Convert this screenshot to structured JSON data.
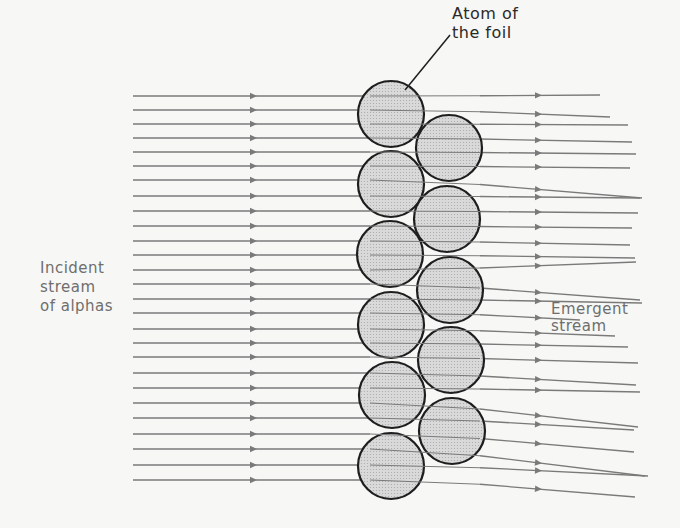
{
  "diagram": {
    "labels": {
      "atom": [
        "Atom of",
        "the foil"
      ],
      "incident": [
        "Incident",
        "stream",
        "of alphas"
      ],
      "emergent": [
        "Emergent",
        "stream"
      ]
    },
    "colors": {
      "background": "#f7f7f5",
      "line": "#7a7a7a",
      "atom_fill": "#d9d9d9",
      "atom_stroke": "#1e1e1e",
      "text": "#6e6e6e",
      "text_dark": "#2a2a2a"
    },
    "atoms": {
      "radius": 33,
      "left_column": [
        [
          391,
          114
        ],
        [
          391,
          184
        ],
        [
          390,
          254
        ],
        [
          391,
          325
        ],
        [
          392,
          395
        ],
        [
          391,
          466
        ]
      ],
      "right_column": [
        [
          449,
          148
        ],
        [
          447,
          219
        ],
        [
          450,
          290
        ],
        [
          451,
          360
        ],
        [
          452,
          431
        ]
      ]
    },
    "pointer_line": [
      [
        405,
        90
      ],
      [
        450,
        35
      ]
    ],
    "incident_start_x": 133,
    "incident_arrow_x": 250,
    "emergent_arrow_x": 535,
    "paths": [
      {
        "y_in": 96,
        "y_out": 95,
        "end_x": 600
      },
      {
        "y_in": 110,
        "y_out": 117,
        "end_x": 610
      },
      {
        "y_in": 124,
        "y_out": 125,
        "end_x": 628
      },
      {
        "y_in": 138,
        "y_out": 142,
        "end_x": 632
      },
      {
        "y_in": 152,
        "y_out": 154,
        "end_x": 636
      },
      {
        "y_in": 166,
        "y_out": 168,
        "end_x": 630
      },
      {
        "y_in": 180,
        "y_out": 198,
        "end_x": 642
      },
      {
        "y_in": 196,
        "y_out": 198,
        "end_x": 640
      },
      {
        "y_in": 211,
        "y_out": 213,
        "end_x": 638
      },
      {
        "y_in": 226,
        "y_out": 228,
        "end_x": 632
      },
      {
        "y_in": 241,
        "y_out": 245,
        "end_x": 630
      },
      {
        "y_in": 255,
        "y_out": 258,
        "end_x": 635
      },
      {
        "y_in": 270,
        "y_out": 262,
        "end_x": 636
      },
      {
        "y_in": 284,
        "y_out": 300,
        "end_x": 640
      },
      {
        "y_in": 299,
        "y_out": 303,
        "end_x": 642
      },
      {
        "y_in": 313,
        "y_out": 320,
        "end_x": 580
      },
      {
        "y_in": 329,
        "y_out": 336,
        "end_x": 615
      },
      {
        "y_in": 343,
        "y_out": 347,
        "end_x": 628
      },
      {
        "y_in": 357,
        "y_out": 363,
        "end_x": 638
      },
      {
        "y_in": 373,
        "y_out": 385,
        "end_x": 636
      },
      {
        "y_in": 388,
        "y_out": 392,
        "end_x": 640
      },
      {
        "y_in": 403,
        "y_out": 427,
        "end_x": 638
      },
      {
        "y_in": 418,
        "y_out": 430,
        "end_x": 634
      },
      {
        "y_in": 434,
        "y_out": 452,
        "end_x": 634
      },
      {
        "y_in": 449,
        "y_out": 476,
        "end_x": 645
      },
      {
        "y_in": 465,
        "y_out": 476,
        "end_x": 648
      },
      {
        "y_in": 480,
        "y_out": 497,
        "end_x": 635
      }
    ]
  }
}
